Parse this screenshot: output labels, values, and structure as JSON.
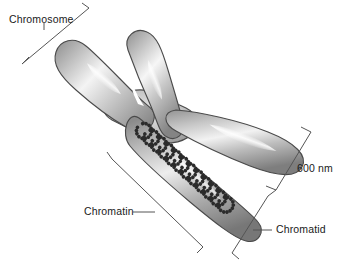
{
  "figure": {
    "background_color": "#ffffff"
  },
  "labels": {
    "chromosome": "Chromosome",
    "scale": "600 nm",
    "chromatin": "Chromatin",
    "chromatid": "Chromatid"
  },
  "colors": {
    "outline": "#4a4a4a",
    "body_light": "#f2f2f2",
    "body_mid": "#b4b4b4",
    "body_dark": "#6e6e6e",
    "highlight": "#fbfbfb",
    "coil": "#2b2b2b",
    "leader": "#555555",
    "text": "#1a1a1a"
  },
  "structure": {
    "arm_count": 4,
    "chromatid_count": 2,
    "coil_loop_count": 12,
    "beads_per_loop": 13,
    "scale_value": "600",
    "scale_unit": "nm"
  }
}
